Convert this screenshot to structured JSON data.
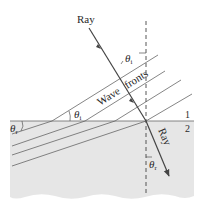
{
  "diagram": {
    "labels": {
      "incident_ray": "Ray",
      "refracted_ray": "Ray",
      "wavefronts": "Wave fronts",
      "wave_word": "Wave",
      "fronts_word": "fronts",
      "theta_i_top": "θi",
      "theta_i_wavefront": "θi",
      "theta_r_left": "θr",
      "theta_r_bottom": "θr",
      "medium_1": "1",
      "medium_2": "2"
    },
    "symbols": {
      "theta": "θ",
      "sub_i": "i",
      "sub_r": "r"
    },
    "colors": {
      "medium_2_fill": "#e6e6e6",
      "line": "#555555",
      "ray": "#444444",
      "text": "#2a2a2a",
      "background": "#ffffff"
    }
  }
}
